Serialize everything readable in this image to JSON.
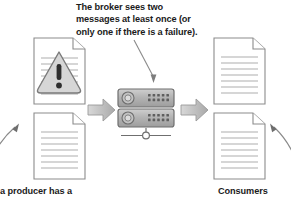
{
  "diagram": {
    "callout_top": "The broker sees two messages at least once (or only one if there is a failure).",
    "caption_bottom_left": "a producer has a",
    "caption_bottom_right": "Consumers",
    "colors": {
      "text": "#1b1b1b",
      "document_outline": "#8c8c8c",
      "document_line": "#c9c9c9",
      "warning_fill": "#d6d6d6",
      "warning_outline": "#7a7a7a",
      "broker_body": "#b5b5b5",
      "broker_outline": "#6f6f6f",
      "arrow_fill": "#b9b9b9",
      "arrow_outline": "#9a9a9a",
      "thin_arrow": "#8a8a8a",
      "background": "#ffffff"
    },
    "nodes": {
      "producer_doc_warning": "document-with-warning",
      "producer_doc_plain": "document-plain",
      "broker": "broker-server-rack",
      "consumer_doc_top": "document-plain",
      "consumer_doc_bottom": "document-plain"
    },
    "broker": {
      "unit_count": 2,
      "led_rows": 2,
      "led_per_row": 5,
      "has_network_stand": true
    },
    "arrows": {
      "producer_to_broker": "block-arrow-right",
      "broker_to_consumer": "block-arrow-right",
      "callout_to_broker": "thin-arrow-down",
      "bottom_left_pointer": "curved-arrow-up-right",
      "bottom_right_pointer": "curved-arrow-up-left"
    }
  }
}
